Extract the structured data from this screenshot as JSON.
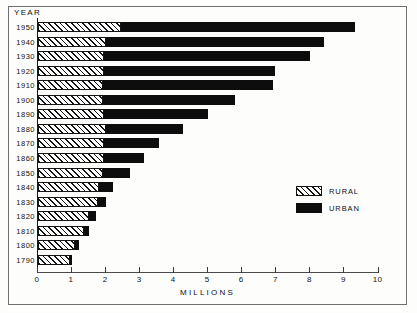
{
  "figure": {
    "year_axis_title": "YEAR",
    "xlabel": "MILLIONS"
  },
  "legend": {
    "position": "inside-right",
    "items": [
      {
        "label": "RURAL",
        "swatch": "hatched-diagonal",
        "color": "#ffffff"
      },
      {
        "label": "URBAN",
        "swatch": "solid",
        "color": "#0d0d0d"
      }
    ]
  },
  "axis": {
    "ticks": [
      {
        "value": 0,
        "label": "0"
      },
      {
        "value": 1,
        "label": "1"
      },
      {
        "value": 2,
        "label": "2"
      },
      {
        "value": 3,
        "label": "3"
      },
      {
        "value": 4,
        "label": "4"
      },
      {
        "value": 5,
        "label": "5"
      },
      {
        "value": 6,
        "label": "6"
      },
      {
        "value": 7,
        "label": "7"
      },
      {
        "value": 8,
        "label": "8"
      },
      {
        "value": 9,
        "label": "9"
      },
      {
        "value": 10,
        "label": "10"
      }
    ]
  },
  "chart_data": {
    "type": "bar",
    "orientation": "horizontal",
    "stacked": true,
    "title": "",
    "xlabel": "MILLIONS",
    "ylabel": "YEAR",
    "xlim": [
      0,
      10
    ],
    "grid": false,
    "legend_position": "inside-right",
    "categories": [
      "1950",
      "1940",
      "1930",
      "1920",
      "1910",
      "1900",
      "1890",
      "1880",
      "1870",
      "1860",
      "1850",
      "1840",
      "1830",
      "1820",
      "1810",
      "1800",
      "1790"
    ],
    "series": [
      {
        "name": "RURAL",
        "color": "#ffffff",
        "pattern": "hatched-diagonal",
        "values": [
          2.45,
          2.0,
          1.95,
          1.95,
          1.9,
          1.9,
          1.95,
          2.0,
          1.95,
          1.95,
          1.9,
          1.8,
          1.75,
          1.5,
          1.35,
          1.1,
          0.95
        ]
      },
      {
        "name": "URBAN",
        "color": "#0d0d0d",
        "pattern": "solid",
        "values": [
          6.85,
          6.4,
          6.05,
          5.0,
          5.0,
          3.9,
          3.05,
          2.25,
          1.6,
          1.15,
          0.8,
          0.4,
          0.25,
          0.2,
          0.15,
          0.1,
          0.05
        ]
      }
    ],
    "totals": [
      9.3,
      8.4,
      8.0,
      6.95,
      6.9,
      5.8,
      5.0,
      4.25,
      3.55,
      3.1,
      2.7,
      2.2,
      2.0,
      1.7,
      1.5,
      1.2,
      1.0
    ]
  }
}
